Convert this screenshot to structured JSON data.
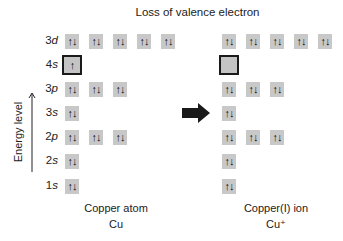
{
  "title": "Loss of valence electron",
  "axis": {
    "label": "Energy level",
    "icon": "up-arrow-icon"
  },
  "transition_icon": "right-arrow-icon",
  "rows": [
    {
      "label_num": "3",
      "label_sub": "d",
      "y": 34
    },
    {
      "label_num": "4",
      "label_sub": "s",
      "y": 57
    },
    {
      "label_num": "3",
      "label_sub": "p",
      "y": 82
    },
    {
      "label_num": "3",
      "label_sub": "s",
      "y": 106
    },
    {
      "label_num": "2",
      "label_sub": "p",
      "y": 130
    },
    {
      "label_num": "2",
      "label_sub": "s",
      "y": 154
    },
    {
      "label_num": "1",
      "label_sub": "s",
      "y": 178
    }
  ],
  "atom": {
    "name": "Copper atom",
    "symbol": "Cu",
    "orbitals": {
      "3d": [
        "↑↓",
        "↑↓",
        "↑↓",
        "↑↓",
        "↑↓"
      ],
      "4s": [
        "↑"
      ],
      "3p": [
        "↑↓",
        "↑↓",
        "↑↓"
      ],
      "3s": [
        "↑↓"
      ],
      "2p": [
        "↑↓",
        "↑↓",
        "↑↓"
      ],
      "2s": [
        "↑↓"
      ],
      "1s": [
        "↑↓"
      ]
    }
  },
  "ion": {
    "name": "Copper(I) ion",
    "symbol": "Cu⁺",
    "orbitals": {
      "3d": [
        "↑↓",
        "↑↓",
        "↑↓",
        "↑↓",
        "↑↓"
      ],
      "4s": [
        ""
      ],
      "3p": [
        "↑↓",
        "↑↓",
        "↑↓"
      ],
      "3s": [
        "↑↓"
      ],
      "2p": [
        "↑↓",
        "↑↓",
        "↑↓"
      ],
      "2s": [
        "↑↓"
      ],
      "1s": [
        "↑↓"
      ]
    }
  },
  "colors": {
    "box_fill": "#c8c8c8",
    "highlight_border": "#1a1a1a",
    "arrow": "#1a1a1a"
  }
}
